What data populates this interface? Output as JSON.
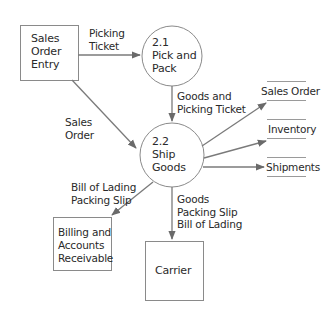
{
  "diagram": {
    "type": "data-flow-diagram",
    "external_entities": [
      {
        "id": "sales_order_entry",
        "label": "Sales\nOrder\nEntry"
      },
      {
        "id": "billing_ar",
        "label": "Billing and\nAccounts\nReceivable"
      },
      {
        "id": "carrier",
        "label": "Carrier"
      }
    ],
    "processes": [
      {
        "id": "p21",
        "label": "2.1\nPick and\nPack"
      },
      {
        "id": "p22",
        "label": "2.2\nShip\nGoods"
      }
    ],
    "data_stores": [
      {
        "id": "ds_sales_order",
        "label": "Sales Order"
      },
      {
        "id": "ds_inventory",
        "label": "Inventory"
      },
      {
        "id": "ds_shipments",
        "label": "Shipments"
      }
    ],
    "flows": [
      {
        "from": "sales_order_entry",
        "to": "p21",
        "label": "Picking\nTicket"
      },
      {
        "from": "sales_order_entry",
        "to": "p22",
        "label": "Sales\nOrder"
      },
      {
        "from": "p21",
        "to": "p22",
        "label": "Goods and\nPicking Ticket"
      },
      {
        "from": "p22",
        "to": "ds_sales_order",
        "label": ""
      },
      {
        "from": "p22",
        "to": "ds_inventory",
        "label": ""
      },
      {
        "from": "p22",
        "to": "ds_shipments",
        "label": ""
      },
      {
        "from": "p22",
        "to": "billing_ar",
        "label": "Bill of Lading\nPacking Slip"
      },
      {
        "from": "p22",
        "to": "carrier",
        "label": "Goods\nPacking Slip\nBill of Lading"
      }
    ],
    "colors": {
      "stroke": "#7a7a7a",
      "arrow": "#6a6a6a",
      "text": "#2a2a2a"
    }
  }
}
